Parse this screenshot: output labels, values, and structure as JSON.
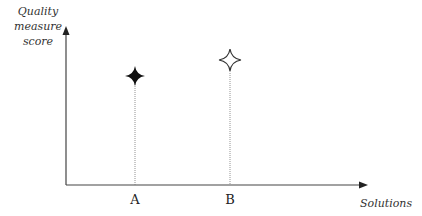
{
  "diagram": {
    "y_axis_label_lines": [
      "Quality",
      "measure",
      "score"
    ],
    "x_axis_label": "Solutions",
    "points": [
      {
        "label": "A",
        "x": 135,
        "y": 76,
        "style": "filled",
        "color": "#111111"
      },
      {
        "label": "B",
        "x": 230,
        "y": 60,
        "style": "outlined",
        "color": "#333333"
      }
    ],
    "axis_color": "#444444"
  }
}
